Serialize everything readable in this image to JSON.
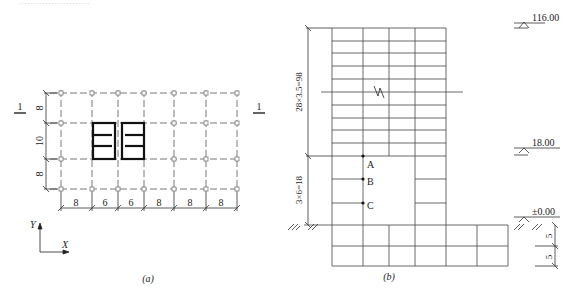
{
  "header_fragment": "……………………",
  "plan": {
    "caption": "(a)",
    "section_mark_left": "1",
    "section_mark_right": "1",
    "x_spans": [
      "8",
      "6",
      "6",
      "8",
      "8",
      "8"
    ],
    "y_spans": [
      "8",
      "10",
      "8"
    ],
    "axis_x": "X",
    "axis_y": "Y"
  },
  "elevation": {
    "caption": "(b)",
    "upper_dim": "28×3.5=98",
    "lower_dim": "3×6=18",
    "basement_dims": [
      "5",
      "5"
    ],
    "levels": [
      "116.00",
      "18.00",
      "±0.00"
    ],
    "points": [
      "A",
      "B",
      "C"
    ]
  },
  "colors": {
    "line": "#333333",
    "core": "#111111",
    "grid_dash": "#555555",
    "column": "#888888"
  }
}
